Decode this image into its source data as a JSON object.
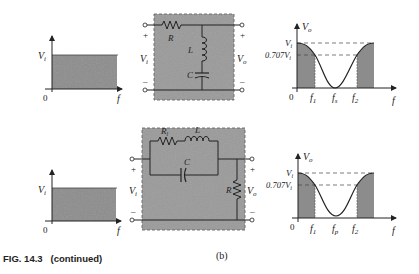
{
  "figure": {
    "caption": "FIG. 14.3   (continued)",
    "part_label": "(b)"
  },
  "colors": {
    "shade": "#8a8a8a",
    "box": "#9a9a9a",
    "line": "#222222"
  },
  "row1": {
    "input_graph": {
      "y_label": "V",
      "y_sub": "i",
      "origin": "0",
      "x_label": "f"
    },
    "circuit": {
      "resistor": "R",
      "inductor": "L",
      "capacitor": "C",
      "in_plus": "+",
      "in_minus": "–",
      "in_label": "V",
      "in_sub": "i",
      "out_plus": "+",
      "out_minus": "–",
      "out_label": "V",
      "out_sub": "o"
    },
    "output_graph": {
      "y_label": "V",
      "y_sub": "o",
      "level_top": "V",
      "level_top_sub": "i",
      "level_707": "0.707V",
      "level_707_sub": "i",
      "origin": "0",
      "f1": "f",
      "f1_sub": "1",
      "fc": "f",
      "fc_sub": "s",
      "f2": "f",
      "f2_sub": "2",
      "x_label": "f"
    }
  },
  "row2": {
    "input_graph": {
      "y_label": "V",
      "y_sub": "i",
      "origin": "0",
      "x_label": "f"
    },
    "circuit": {
      "resistor_series": "R",
      "resistor_series_sub": "l",
      "inductor": "L",
      "capacitor": "C",
      "load_resistor": "R",
      "in_plus": "+",
      "in_minus": "–",
      "in_label": "V",
      "in_sub": "i",
      "out_plus": "+",
      "out_minus": "–",
      "out_label": "V",
      "out_sub": "o"
    },
    "output_graph": {
      "y_label": "V",
      "y_sub": "o",
      "level_top": "V",
      "level_top_sub": "i",
      "level_707": "0.707V",
      "level_707_sub": "i",
      "origin": "0",
      "f1": "f",
      "f1_sub": "1",
      "fc": "f",
      "fc_sub": "p",
      "f2": "f",
      "f2_sub": "2",
      "x_label": "f"
    }
  }
}
